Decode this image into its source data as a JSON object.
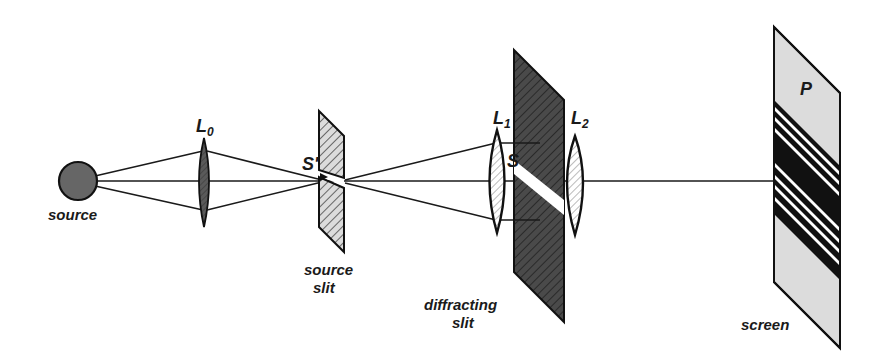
{
  "diagram": {
    "type": "optical-setup",
    "components": {
      "source": {
        "label": "source",
        "color": "#666666"
      },
      "lens_l0": {
        "label": "L",
        "subscript": "0",
        "color": "#555555"
      },
      "source_slit": {
        "point_label": "S'",
        "caption_line1": "source",
        "caption_line2": "slit",
        "color": "#d9d9d9"
      },
      "lens_l1": {
        "label": "L",
        "subscript": "1"
      },
      "diffracting_slit": {
        "point_label": "S",
        "caption_line1": "diffracting",
        "caption_line2": "slit",
        "color": "#4d4d4d"
      },
      "lens_l2": {
        "label": "L",
        "subscript": "2"
      },
      "screen": {
        "label": "screen",
        "point_label": "P",
        "color": "#dcdcdc"
      }
    },
    "colors": {
      "line": "#1a1a1a",
      "fringe_dark": "#111111",
      "fringe_light": "#ffffff"
    }
  }
}
